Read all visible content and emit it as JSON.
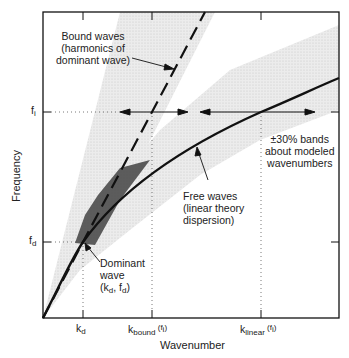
{
  "diagram": {
    "type": "dispersion-relation-sketch",
    "axes": {
      "x_label": "Wavenumber",
      "y_label": "Frequency",
      "x_ticks": [
        {
          "id": "kd",
          "base": "k",
          "sub": "d",
          "suffix": ""
        },
        {
          "id": "kbound",
          "base": "k",
          "sub": "bound",
          "suffix": " (f",
          "suffix_sub": "i",
          "suffix_end": ")"
        },
        {
          "id": "klinear",
          "base": "k",
          "sub": "linear",
          "suffix": " (f",
          "suffix_sub": "i",
          "suffix_end": ")"
        }
      ],
      "y_ticks": [
        {
          "id": "fi",
          "base": "f",
          "sub": "i"
        },
        {
          "id": "fd",
          "base": "f",
          "sub": "d"
        }
      ]
    },
    "annotations": {
      "bound_waves": [
        "Bound waves",
        "(harmonics of",
        "dominant wave)"
      ],
      "bands": [
        "±30% bands",
        "about modeled",
        "wavenumbers"
      ],
      "free_waves": [
        "Free waves",
        "(linear theory",
        "dispersion)"
      ],
      "dominant": {
        "line1": "Dominant",
        "line2": "wave",
        "line3_parts": [
          "(k",
          "d",
          ", f",
          "d",
          ")"
        ]
      }
    },
    "curves": [
      {
        "name": "Free waves (linear theory dispersion)",
        "style": "solid"
      },
      {
        "name": "Bound waves (harmonics of dominant wave)",
        "style": "dashed"
      }
    ],
    "colors": {
      "line": "#111111",
      "band": "#d9d9d9",
      "scatter": "#333333"
    }
  }
}
